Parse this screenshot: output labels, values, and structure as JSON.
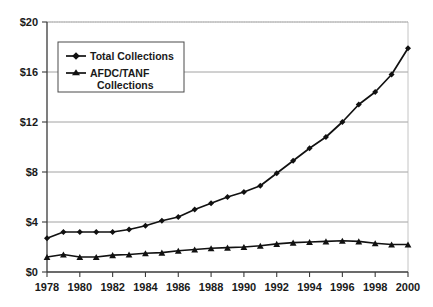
{
  "chart_data": {
    "type": "line",
    "title": "",
    "xlabel": "",
    "ylabel": "",
    "x": [
      1978,
      1979,
      1980,
      1981,
      1982,
      1983,
      1984,
      1985,
      1986,
      1987,
      1988,
      1989,
      1990,
      1991,
      1992,
      1993,
      1994,
      1995,
      1996,
      1997,
      1998,
      1999,
      2000
    ],
    "xlim": [
      1978,
      2000
    ],
    "ylim": [
      0,
      20
    ],
    "grid": true,
    "legend_position": "upper-left-inside",
    "y_tick_labels": [
      "$0",
      "$4",
      "$8",
      "$12",
      "$16",
      "$20"
    ],
    "y_tick_values": [
      0,
      4,
      8,
      12,
      16,
      20
    ],
    "x_tick_labels": [
      "1978",
      "1980",
      "1982",
      "1984",
      "1986",
      "1988",
      "1990",
      "1992",
      "1994",
      "1996",
      "1998",
      "2000"
    ],
    "x_tick_values": [
      1978,
      1980,
      1982,
      1984,
      1986,
      1988,
      1990,
      1992,
      1994,
      1996,
      1998,
      2000
    ],
    "series": [
      {
        "name": "Total Collections",
        "marker": "diamond",
        "color": "#111111",
        "values": [
          2.7,
          3.2,
          3.2,
          3.2,
          3.2,
          3.4,
          3.7,
          4.1,
          4.4,
          5.0,
          5.5,
          6.0,
          6.4,
          6.9,
          7.9,
          8.9,
          9.9,
          10.8,
          12.0,
          13.4,
          14.4,
          15.8,
          17.9
        ]
      },
      {
        "name": "AFDC/TANF Collections",
        "marker": "triangle",
        "color": "#111111",
        "values": [
          1.2,
          1.4,
          1.2,
          1.2,
          1.35,
          1.4,
          1.5,
          1.55,
          1.7,
          1.8,
          1.9,
          1.95,
          2.0,
          2.1,
          2.25,
          2.35,
          2.4,
          2.45,
          2.5,
          2.45,
          2.3,
          2.2,
          2.2
        ]
      }
    ]
  },
  "legend": {
    "entries": [
      {
        "label": "Total Collections",
        "line2": ""
      },
      {
        "label": "AFDC/TANF",
        "line2": "Collections"
      }
    ]
  }
}
